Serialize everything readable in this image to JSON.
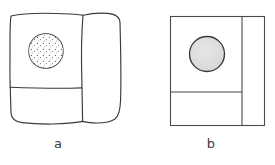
{
  "figure": {
    "background_color": "#ffffff",
    "stroke_color": "#3a3a3a",
    "panels": [
      {
        "id": "a",
        "label": "a",
        "style": "hand-drawn",
        "description": "Hand-drawn wavy-edged rectangular slab with a vertical break line near the right side, a horizontal bedding line in the lower portion, and a stippled (dotted) rounded nodule in the upper-left area",
        "outline": {
          "shape": "rounded-wavy-rectangle",
          "x": 10,
          "y": 13,
          "width": 112,
          "height": 110
        },
        "vertical_divider_x": 82,
        "horizontal_divider_y": 88,
        "circle": {
          "name": "stippled-nodule",
          "cx": 46,
          "cy": 51,
          "r": 17,
          "fill": "#ffffff",
          "texture": "stipple-dots",
          "dot_color": "#555555"
        }
      },
      {
        "id": "b",
        "label": "b",
        "style": "straight-edged",
        "description": "Straight-edged rectangle with a vertical divider near the right side, a horizontal divider in the lower-left portion, and a solid light-grey filled circle in the upper area",
        "outline": {
          "shape": "rectangle",
          "x": 170,
          "y": 16,
          "width": 95,
          "height": 110
        },
        "vertical_divider_x": 242,
        "horizontal_divider_y": 92,
        "circle": {
          "name": "grey-nodule",
          "cx": 207,
          "cy": 54,
          "r": 18,
          "fill": "#dedede",
          "texture": "solid-grey",
          "dot_color": "#cfcfcf"
        }
      }
    ],
    "labels": {
      "a": "a",
      "b": "b"
    }
  }
}
